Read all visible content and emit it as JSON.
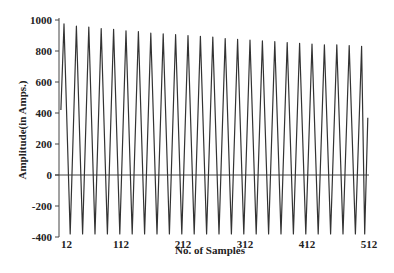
{
  "chart_data": {
    "type": "line",
    "title": "",
    "xlabel": "No. of Samples",
    "ylabel": "Amplitude(in Amps.)",
    "xlim": [
      12,
      512
    ],
    "ylim": [
      -400,
      1000
    ],
    "x_ticks": [
      12,
      112,
      212,
      312,
      412,
      512
    ],
    "y_ticks": [
      -400,
      -200,
      0,
      200,
      400,
      600,
      800,
      1000
    ],
    "grid": false,
    "legend": null,
    "series": [
      {
        "name": "Current waveform",
        "color": "#333333",
        "x": [
          15,
          20,
          30,
          40,
          50,
          60,
          70,
          80,
          90,
          100,
          110,
          120,
          130,
          140,
          150,
          160,
          170,
          180,
          190,
          200,
          210,
          220,
          230,
          240,
          250,
          260,
          270,
          280,
          290,
          300,
          310,
          320,
          330,
          340,
          350,
          360,
          370,
          380,
          390,
          400,
          410,
          420,
          430,
          440,
          450,
          460,
          470,
          480,
          490,
          500,
          505,
          510
        ],
        "values": [
          420,
          975,
          -380,
          960,
          -380,
          955,
          -380,
          945,
          -380,
          940,
          -380,
          930,
          -380,
          925,
          -380,
          915,
          -380,
          910,
          -380,
          905,
          -380,
          900,
          -380,
          895,
          -380,
          890,
          -380,
          880,
          -380,
          875,
          -380,
          870,
          -380,
          865,
          -380,
          860,
          -380,
          855,
          -380,
          850,
          -380,
          845,
          -380,
          840,
          -380,
          840,
          -380,
          835,
          -380,
          830,
          -380,
          370
        ]
      }
    ],
    "annotations": []
  },
  "axes": {
    "x_title": "No. of Samples",
    "y_title": "Amplitude(in Amps.)",
    "x_tick_labels": [
      "12",
      "112",
      "212",
      "312",
      "412",
      "512"
    ],
    "y_tick_labels": [
      "-400",
      "-200",
      "0",
      "200",
      "400",
      "600",
      "800",
      "1000"
    ]
  }
}
